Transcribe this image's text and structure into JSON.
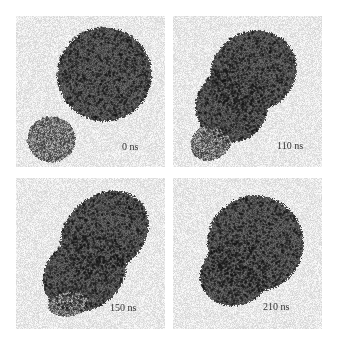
{
  "figure": {
    "panels": [
      {
        "time_label": "0 ns"
      },
      {
        "time_label": "110 ns"
      },
      {
        "time_label": "150 ns"
      },
      {
        "time_label": "210 ns"
      }
    ],
    "colors": {
      "background": "#ffffff",
      "solvent": "#e4e4e4",
      "particle_dark": "#2f2f2f",
      "particle_light": "#8a8a8a"
    }
  }
}
